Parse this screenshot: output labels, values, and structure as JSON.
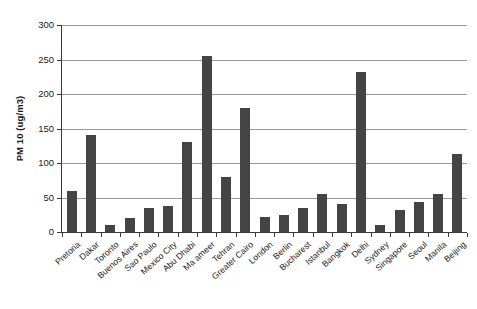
{
  "chart_data": {
    "type": "bar",
    "title": "",
    "subtitle": "",
    "xlabel": "",
    "ylabel": "PM 10 (ug/m3)",
    "ylim": [
      0,
      300
    ],
    "ytick_labels": [
      "0",
      "50",
      "100",
      "150",
      "200",
      "250",
      "300"
    ],
    "ytick_values": [
      0,
      50,
      100,
      150,
      200,
      250,
      300
    ],
    "grid": "horizontal",
    "legend": "none",
    "bar_color": "#444444",
    "gridline_color": "#9a9a9a",
    "axis_color": "#3a3a3a",
    "categories": [
      "Pretoria",
      "Dakar",
      "Toronto",
      "Buenos Aires",
      "Sao Paulo",
      "Mexico City",
      "Abu Dhabi",
      "Ma ameer",
      "Tehran",
      "Greater Cairo",
      "London",
      "Berlin",
      "Bucharest",
      "Istanbul",
      "Bangkok",
      "Delhi",
      "Sydney",
      "Singapore",
      "Seoul",
      "Manila",
      "Beijing"
    ],
    "values": [
      60,
      140,
      10,
      20,
      35,
      38,
      130,
      255,
      80,
      180,
      22,
      25,
      35,
      55,
      41,
      232,
      10,
      32,
      44,
      55,
      113
    ]
  }
}
